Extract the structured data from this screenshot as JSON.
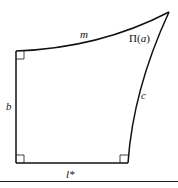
{
  "figure": {
    "type": "hyperbolic-quadrilateral",
    "vertices": {
      "top_left": [
        16,
        51
      ],
      "bottom_left": [
        16,
        163
      ],
      "bottom_right": [
        128,
        163
      ],
      "top_right": [
        169,
        12
      ]
    },
    "right_angle_markers": [
      "top_left",
      "bottom_left",
      "bottom_right"
    ],
    "labels": {
      "top_side": "m",
      "angle": "Π(a)",
      "angle_symbol": "Π",
      "angle_arg": "a",
      "right_side": "c",
      "left_side": "b",
      "bottom_side": "l*"
    },
    "colors": {
      "stroke": "#111111",
      "background": "#ffffff"
    }
  }
}
